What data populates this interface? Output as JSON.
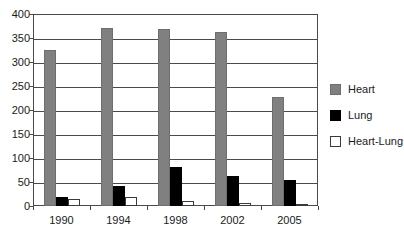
{
  "chart_data": {
    "type": "bar",
    "title": "",
    "subtitle": "",
    "xlabel": "",
    "ylabel": "",
    "categories": [
      "1990",
      "1994",
      "1998",
      "2002",
      "2005"
    ],
    "series": [
      {
        "name": "Heart",
        "color": "#808080",
        "values": [
          325,
          370,
          368,
          362,
          228
        ]
      },
      {
        "name": "Lung",
        "color": "#000000",
        "values": [
          18,
          42,
          82,
          62,
          55
        ]
      },
      {
        "name": "Heart-Lung",
        "color": "#ffffff",
        "values": [
          14,
          19,
          10,
          6,
          4
        ]
      }
    ],
    "ylim": [
      0,
      400
    ],
    "yticks": [
      0,
      50,
      100,
      150,
      200,
      250,
      300,
      350,
      400
    ],
    "ytick_labels": [
      "0",
      "50",
      "100",
      "150",
      "200",
      "250",
      "300",
      "350",
      "400"
    ],
    "grid": true,
    "legend_position": "right"
  },
  "legend": {
    "items": [
      {
        "label": "Heart"
      },
      {
        "label": "Lung"
      },
      {
        "label": "Heart-Lung"
      }
    ]
  }
}
